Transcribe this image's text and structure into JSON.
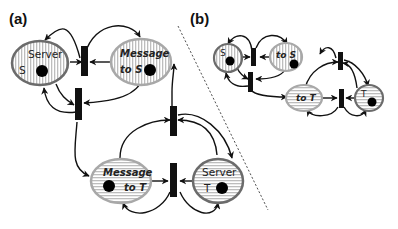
{
  "diagram": {
    "type": "petri-net",
    "panels": [
      {
        "id": "a",
        "label": "(a)",
        "places": [
          {
            "id": "server_s",
            "line1": "Server",
            "line2": "S",
            "tokens": 1,
            "fill": "vertical-stripes",
            "border": "dark"
          },
          {
            "id": "message_to_s",
            "line1": "Message",
            "line2": "to S",
            "tokens": 1,
            "fill": "vertical-stripes",
            "border": "light"
          },
          {
            "id": "message_to_t",
            "line1": "Message",
            "line2": "to T",
            "tokens": 1,
            "fill": "horizontal-stripes",
            "border": "light"
          },
          {
            "id": "server_t",
            "line1": "Server",
            "line2": "T",
            "tokens": 1,
            "fill": "horizontal-stripes",
            "border": "dark"
          }
        ],
        "transitions": 4
      },
      {
        "id": "b",
        "label": "(b)",
        "places": [
          {
            "id": "s",
            "line1": "S",
            "tokens": 1,
            "fill": "vertical-stripes",
            "border": "dark"
          },
          {
            "id": "to_s",
            "line1": "to S",
            "tokens": 1,
            "fill": "vertical-stripes",
            "border": "light"
          },
          {
            "id": "to_t",
            "line1": "to T",
            "tokens": 0,
            "fill": "horizontal-stripes",
            "border": "light"
          },
          {
            "id": "t",
            "line1": "T",
            "tokens": 1,
            "fill": "horizontal-stripes",
            "border": "dark"
          }
        ],
        "transitions": 4
      }
    ],
    "colors": {
      "dark_border": "#6b6b6b",
      "light_border": "#a8a8a8",
      "stripe": "#bdbdbd",
      "transition": "#111111",
      "token": "#000000"
    }
  }
}
